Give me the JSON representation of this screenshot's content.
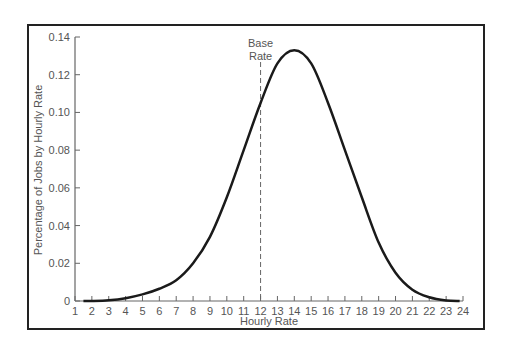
{
  "chart_data": {
    "type": "line",
    "title": "",
    "xlabel": "Hourly Rate",
    "ylabel": "Percentage of Jobs by Hourly Rate",
    "xlim": [
      1,
      24
    ],
    "ylim": [
      0,
      0.14
    ],
    "x_ticks": [
      "1",
      "2",
      "3",
      "4",
      "5",
      "6",
      "7",
      "8",
      "9",
      "10",
      "11",
      "12",
      "13",
      "14",
      "15",
      "16",
      "17",
      "18",
      "19",
      "20",
      "21",
      "22",
      "23",
      "24"
    ],
    "y_ticks": [
      "0",
      "0.02",
      "0.04",
      "0.06",
      "0.08",
      "0.10",
      "0.12",
      "0.14"
    ],
    "grid": false,
    "legend": null,
    "series": [
      {
        "name": "Distribution of Jobs",
        "x": [
          1.5,
          2,
          3,
          4,
          5,
          6,
          7,
          8,
          9,
          10,
          11,
          12,
          13,
          14,
          15,
          16,
          17,
          18,
          19,
          20,
          21,
          22,
          23,
          23.8
        ],
        "values": [
          0.0,
          0.0,
          0.0004,
          0.0015,
          0.0035,
          0.0065,
          0.011,
          0.02,
          0.034,
          0.055,
          0.08,
          0.105,
          0.126,
          0.133,
          0.126,
          0.105,
          0.08,
          0.055,
          0.031,
          0.015,
          0.006,
          0.002,
          0.0003,
          0.0
        ]
      }
    ],
    "annotations": [
      {
        "type": "vline",
        "x": 12,
        "style": "dashed",
        "label": "Base Rate"
      }
    ]
  },
  "labels": {
    "annotation_line1": "Base",
    "annotation_line2": "Rate",
    "xlabel": "Hourly Rate",
    "ylabel": "Percentage of Jobs by Hourly Rate"
  },
  "colors": {
    "curve": "#1a1a1a",
    "axis": "#666666",
    "text": "#555555",
    "frame": "#222222"
  }
}
